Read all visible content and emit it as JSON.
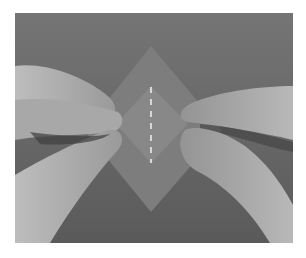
{
  "image": {
    "subject": "hands folding a square sheet of paper into a diamond",
    "fold_line": "dashed vertical crease guide",
    "colors": {
      "background": "#6b6b6b",
      "paper": "#808080",
      "paper_inner": "#8a8a8a",
      "hands": "#a6a6a6",
      "dashes": "#f2f2f2"
    }
  }
}
